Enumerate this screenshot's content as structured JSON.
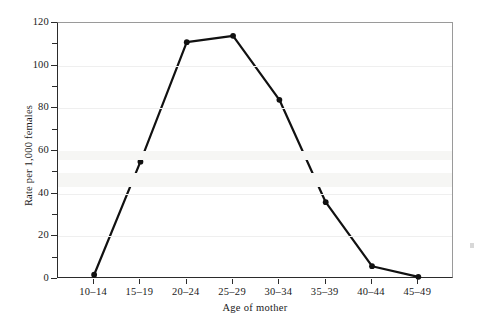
{
  "chart_data": {
    "type": "line",
    "title": "",
    "xlabel": "Age of mother",
    "ylabel": "Rate per 1,000 females",
    "categories": [
      "10–14",
      "15–19",
      "20–24",
      "25–29",
      "30–34",
      "35–39",
      "40–44",
      "45–49"
    ],
    "values": [
      2,
      55,
      111,
      114,
      84,
      36,
      6,
      1
    ],
    "series": [
      {
        "name": "Birth rate",
        "values": [
          2,
          55,
          111,
          114,
          84,
          36,
          6,
          1
        ]
      }
    ],
    "ylim": [
      0,
      120
    ],
    "y_ticks": [
      0,
      20,
      40,
      60,
      80,
      100,
      120
    ],
    "y_minor_ticks": [
      10,
      30,
      50,
      70,
      90,
      110
    ],
    "y_tick_labels": [
      "0",
      "20",
      "40",
      "60",
      "80",
      "100",
      "120"
    ],
    "grid": true,
    "grid_axis": "y",
    "legend": false,
    "legend_position": "none",
    "marker": "filled-circle",
    "line_color": "#111111",
    "marker_color": "#111111",
    "grid_color": "#efefef",
    "axis_color": "#2b2b2b",
    "frame_color": "#9a9a9a",
    "background": "#ffffff"
  },
  "axes": {
    "y_title": "Rate per 1,000 females",
    "x_title": "Age of mother"
  }
}
